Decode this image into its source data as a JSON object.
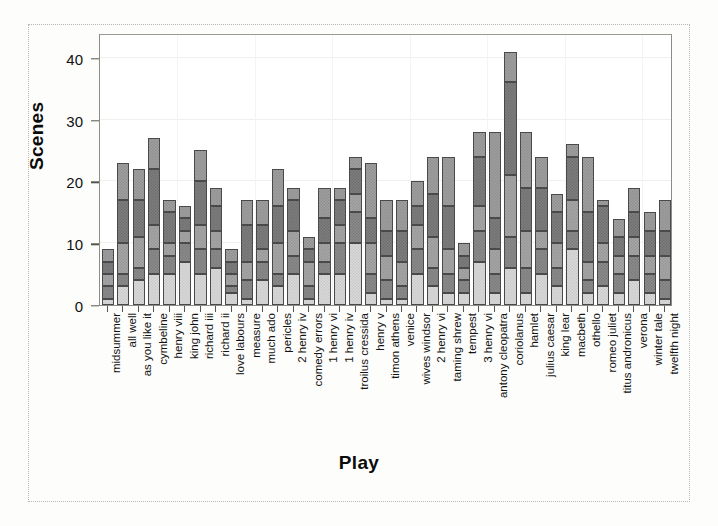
{
  "figure": {
    "background": "#fdfdfb",
    "frame_color": "#b9b9b4"
  },
  "axis": {
    "y_title": "Scenes",
    "x_title": "Play",
    "y_ticks": [
      "0",
      "10",
      "20",
      "30",
      "40"
    ]
  },
  "chart_data": {
    "type": "bar",
    "stacked": true,
    "title": "",
    "xlabel": "Play",
    "ylabel": "Scenes",
    "ylim": [
      0,
      44
    ],
    "yticks": [
      0,
      10,
      20,
      30,
      40
    ],
    "grid": true,
    "legend": "none",
    "series": [
      {
        "name": "act 1",
        "color": "#d8d8d8",
        "values": [
          1,
          3,
          4,
          5,
          5,
          7,
          5,
          6,
          2,
          1,
          4,
          3,
          5,
          1,
          5,
          5,
          10,
          2,
          1,
          1,
          5,
          3,
          2,
          2,
          7,
          2,
          6,
          2,
          5,
          3,
          9,
          2,
          3,
          2,
          4,
          2,
          1
        ]
      },
      {
        "name": "act 2",
        "color": "#8a8a8a",
        "values": [
          2,
          2,
          2,
          4,
          3,
          3,
          4,
          3,
          1,
          3,
          3,
          2,
          3,
          2,
          2,
          5,
          5,
          3,
          3,
          2,
          4,
          3,
          3,
          2,
          5,
          3,
          5,
          4,
          4,
          3,
          3,
          2,
          4,
          3,
          4,
          3,
          3
        ]
      },
      {
        "name": "act 3",
        "color": "#a5a5a5",
        "values": [
          2,
          5,
          5,
          4,
          2,
          2,
          4,
          3,
          2,
          3,
          2,
          5,
          4,
          4,
          3,
          3,
          3,
          5,
          4,
          4,
          4,
          5,
          4,
          2,
          4,
          4,
          10,
          6,
          3,
          4,
          5,
          3,
          3,
          3,
          3,
          3,
          4
        ]
      },
      {
        "name": "act 4",
        "color": "#7d7d7d",
        "values": [
          2,
          7,
          6,
          9,
          5,
          2,
          7,
          4,
          2,
          6,
          4,
          6,
          5,
          2,
          4,
          4,
          4,
          4,
          4,
          5,
          3,
          7,
          7,
          2,
          8,
          5,
          15,
          7,
          7,
          5,
          7,
          8,
          6,
          3,
          4,
          4,
          4
        ]
      },
      {
        "name": "act 5",
        "color": "#9e9e9e",
        "values": [
          2,
          6,
          5,
          5,
          2,
          2,
          5,
          3,
          2,
          4,
          4,
          6,
          2,
          2,
          5,
          2,
          2,
          9,
          5,
          5,
          4,
          6,
          8,
          2,
          4,
          14,
          5,
          9,
          5,
          3,
          2,
          9,
          1,
          3,
          4,
          3,
          5
        ]
      }
    ],
    "categories": [
      "midsummer",
      "all well",
      "as you like it",
      "cymbeline",
      "henry viii",
      "king john",
      "richard iii",
      "richard ii",
      "love labours",
      "measure",
      "much ado",
      "pericles",
      "2 henry iv",
      "comedy errors",
      "1 henry vi",
      "1 henry iv",
      "troilus cressida",
      "henry v",
      "timon athens",
      "venice",
      "wives windsor",
      "2 henry vi",
      "taming shrew",
      "tempest",
      "3 henry vi",
      "antony cleopatra",
      "coriolanus",
      "hamlet",
      "julius caesar",
      "king lear",
      "macbeth",
      "othello",
      "romeo juliet",
      "titus andronicus",
      "verona",
      "winter tale",
      "twelfth night"
    ],
    "totals": [
      9,
      23,
      22,
      27,
      17,
      16,
      25,
      19,
      9,
      17,
      17,
      22,
      19,
      11,
      19,
      19,
      24,
      23,
      17,
      17,
      20,
      24,
      24,
      10,
      28,
      28,
      41,
      28,
      24,
      18,
      26,
      24,
      17,
      14,
      19,
      15,
      17
    ]
  }
}
